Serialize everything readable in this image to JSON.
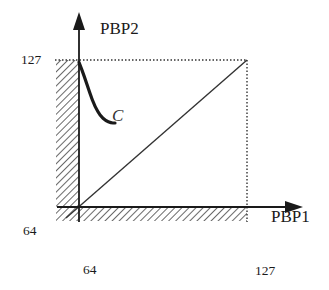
{
  "diagram": {
    "title": "",
    "axes": {
      "x": {
        "label": "PBP1",
        "min_label": "64",
        "max_label": "127",
        "min": 64,
        "max": 127
      },
      "y": {
        "label": "PBP2",
        "min_label": "64",
        "max_label": "127",
        "min": 64,
        "max": 127
      }
    },
    "curve": {
      "label": "C",
      "description": "Thick curve descending from top of PBP2 axis, flattening toward the diagonal",
      "points": [
        [
          64,
          126
        ],
        [
          66,
          120
        ],
        [
          68,
          113
        ],
        [
          70,
          107
        ],
        [
          72,
          103
        ],
        [
          74,
          101
        ],
        [
          76,
          100
        ],
        [
          77.5,
          100
        ]
      ]
    },
    "diagonal": {
      "description": "Identity line PBP2 = PBP1",
      "from": [
        64,
        64
      ],
      "to": [
        127,
        127
      ]
    },
    "bounds": {
      "description": "Dotted boundary at 127 on both axes"
    },
    "excluded_regions": {
      "description": "Hatched strips below 64 on both axes"
    },
    "colors": {
      "ink": "#1a1a1a",
      "dotted": "#333333",
      "hatch": "#444444"
    }
  }
}
